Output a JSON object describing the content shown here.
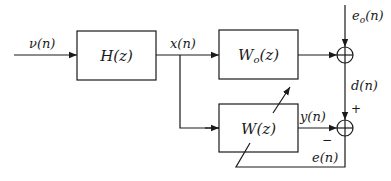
{
  "diagram": {
    "type": "block-diagram",
    "blocks": [
      {
        "id": "H",
        "label": "H(z)"
      },
      {
        "id": "Wo",
        "label": "Wo(z)",
        "label_main": "W",
        "label_sub": "o",
        "label_tail": "(z)"
      },
      {
        "id": "W",
        "label": "W(z)"
      }
    ],
    "summers": [
      {
        "id": "sum1",
        "inputs": [
          "Wo(z) output",
          "eo(n)"
        ],
        "output": "d(n)"
      },
      {
        "id": "sum2",
        "inputs": [
          "d(n) (+)",
          "y(n) (−)"
        ],
        "output": "e(n)"
      }
    ],
    "signals": {
      "input": "ν(n)",
      "x": "x(n)",
      "eo_main": "e",
      "eo_sub": "o",
      "eo_tail": "(n)",
      "d": "d(n)",
      "y": "y(n)",
      "e": "e(n)"
    },
    "signs": {
      "plus": "+",
      "minus": "−"
    }
  }
}
